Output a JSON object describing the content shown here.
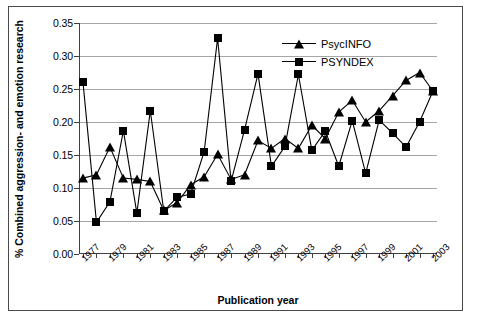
{
  "chart_data": {
    "type": "line",
    "title": "",
    "xlabel": "Publication year",
    "ylabel": "% Combined aggression- and emotion research",
    "xlim": [
      1977,
      2003
    ],
    "ylim": [
      0.0,
      0.35
    ],
    "ytick_step": 0.05,
    "ytick_labels": [
      "0.00",
      "0.05",
      "0.10",
      "0.15",
      "0.20",
      "0.25",
      "0.30",
      "0.35"
    ],
    "ytick_values": [
      0.0,
      0.05,
      0.1,
      0.15,
      0.2,
      0.25,
      0.3,
      0.35
    ],
    "grid": "horizontal",
    "legend_position": "top-right-inside",
    "x": [
      1977,
      1978,
      1979,
      1980,
      1981,
      1982,
      1983,
      1984,
      1985,
      1986,
      1987,
      1988,
      1989,
      1990,
      1991,
      1992,
      1993,
      1994,
      1995,
      1996,
      1997,
      1998,
      1999,
      2000,
      2001,
      2002,
      2003
    ],
    "xtick_labels": [
      "1977",
      "",
      "1979",
      "",
      "1981",
      "",
      "1983",
      "",
      "1985",
      "",
      "1987",
      "",
      "1989",
      "",
      "1991",
      "",
      "1993",
      "",
      "1995",
      "",
      "1997",
      "",
      "1999",
      "",
      "2001",
      "",
      "2003"
    ],
    "series": [
      {
        "name": "PsycINFO",
        "marker": "triangle",
        "color": "#000000",
        "values": [
          0.115,
          0.12,
          0.162,
          0.115,
          0.113,
          0.11,
          0.066,
          0.078,
          0.105,
          0.117,
          0.151,
          0.113,
          0.12,
          0.172,
          0.16,
          0.175,
          0.16,
          0.195,
          0.175,
          0.215,
          0.233,
          0.2,
          0.217,
          0.24,
          0.263,
          0.275,
          0.247
        ]
      },
      {
        "name": "PSYNDEX",
        "marker": "square",
        "color": "#000000",
        "values": [
          0.26,
          0.048,
          0.079,
          0.187,
          0.062,
          0.217,
          0.065,
          0.086,
          0.091,
          0.155,
          0.327,
          0.11,
          0.188,
          0.273,
          0.133,
          0.163,
          0.272,
          0.157,
          0.186,
          0.133,
          0.202,
          0.122,
          0.203,
          0.183,
          0.162,
          0.2,
          0.247
        ]
      }
    ]
  },
  "legend": {
    "items": [
      {
        "label": "PsycINFO",
        "marker": "triangle"
      },
      {
        "label": "PSYNDEX",
        "marker": "square"
      }
    ]
  }
}
